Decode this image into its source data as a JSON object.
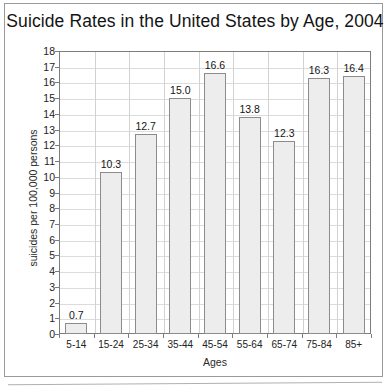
{
  "chart_data": {
    "type": "bar",
    "title": "Suicide Rates in the United States by Age, 2004",
    "xlabel": "Ages",
    "ylabel": "suicides per 100,000 persons",
    "categories": [
      "5-14",
      "15-24",
      "25-34",
      "35-44",
      "45-54",
      "55-64",
      "65-74",
      "75-84",
      "85+"
    ],
    "values": [
      0.7,
      10.3,
      12.7,
      15.0,
      16.6,
      13.8,
      12.3,
      16.3,
      16.4
    ],
    "value_labels": [
      "0.7",
      "10.3",
      "12.7",
      "15.0",
      "16.6",
      "13.8",
      "12.3",
      "16.3",
      "16.4"
    ],
    "ylim": [
      0,
      18
    ],
    "ytick_step": 1,
    "ytick_labels": [
      "18",
      "17",
      "16",
      "15",
      "14",
      "13",
      "12",
      "11",
      "10",
      "9",
      "8",
      "7",
      "6",
      "5",
      "4",
      "3",
      "2",
      "1",
      "0"
    ],
    "grid": "horizontal",
    "legend": "none",
    "bar_fill": "#ededed",
    "bar_border": "#8c8c8c",
    "gridline_color": "#dcdcdc",
    "axis_color": "#7d7d7d"
  },
  "footnote": {
    "clipped_text": ""
  }
}
